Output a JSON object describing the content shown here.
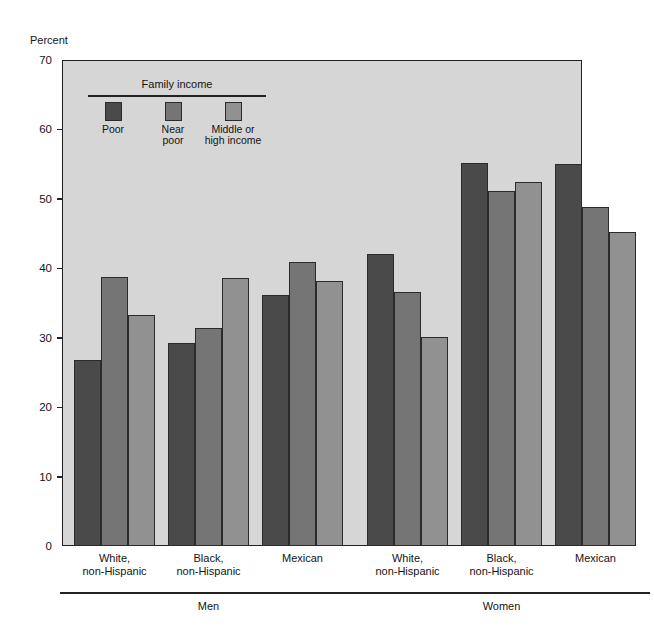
{
  "chart_data": {
    "type": "bar",
    "title": "",
    "subtitle": "",
    "xlabel": "",
    "ylabel": "Percent",
    "ylim": [
      0,
      70
    ],
    "yticks": [
      0,
      10,
      20,
      30,
      40,
      50,
      60,
      70
    ],
    "grid": false,
    "legend_position": "inside-top-left",
    "legend_title": "Family income",
    "series": [
      {
        "name": "Poor",
        "color": "#4a4a4a",
        "values": [
          26.8,
          29.3,
          36.2,
          42.0,
          55.1,
          55.0
        ]
      },
      {
        "name": "Near\npoor",
        "color": "#757575",
        "values": [
          38.8,
          31.4,
          40.9,
          36.6,
          51.1,
          48.8
        ]
      },
      {
        "name": "Middle or\nhigh income",
        "color": "#919191",
        "values": [
          33.3,
          38.6,
          38.2,
          30.1,
          52.5,
          45.3
        ]
      }
    ],
    "categories": [
      "White,\nnon-Hispanic",
      "Black,\nnon-Hispanic",
      "Mexican",
      "White,\nnon-Hispanic",
      "Black,\nnon-Hispanic",
      "Mexican"
    ],
    "supergroups": [
      {
        "label": "Men",
        "categories": [
          0,
          1,
          2
        ]
      },
      {
        "label": "Women",
        "categories": [
          3,
          4,
          5
        ]
      }
    ],
    "annotations": []
  },
  "axis": {
    "y_title": "Percent",
    "y_tick_labels": [
      "70",
      "60",
      "50",
      "40",
      "30",
      "20",
      "10",
      "0"
    ]
  },
  "legend": {
    "title": "Family income",
    "items": [
      {
        "label": "Poor",
        "color": "#4a4a4a"
      },
      {
        "label": "Near\npoor",
        "color": "#757575"
      },
      {
        "label": "Middle or\nhigh income",
        "color": "#919191"
      }
    ]
  },
  "x_axis": {
    "group_labels": [
      "White,\nnon-Hispanic",
      "Black,\nnon-Hispanic",
      "Mexican",
      "White,\nnon-Hispanic",
      "Black,\nnon-Hispanic",
      "Mexican"
    ],
    "supergroup_labels": [
      "Men",
      "Women"
    ]
  },
  "colors": {
    "plot_background": "#d6d6d6",
    "page_background": "#ffffff",
    "axis": "#222222",
    "series_poor": "#4a4a4a",
    "series_near_poor": "#757575",
    "series_middle_high": "#919191"
  }
}
